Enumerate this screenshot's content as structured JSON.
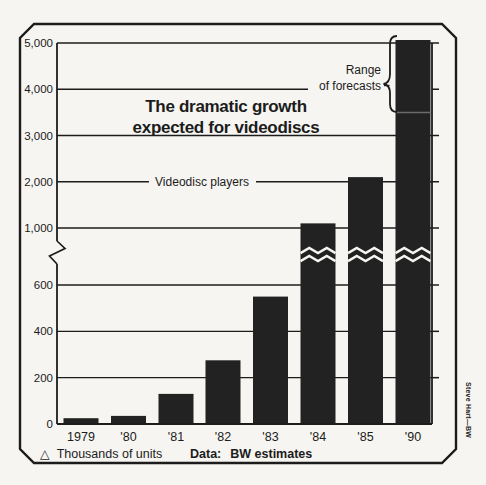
{
  "chart_data": {
    "type": "bar",
    "title_line1": "The dramatic growth",
    "title_line2": "expected for videodiscs",
    "series_label": "Videodisc players",
    "categories": [
      "1979",
      "'80",
      "'81",
      "'82",
      "'83",
      "'84",
      "'85",
      "'90"
    ],
    "values": [
      25,
      35,
      130,
      275,
      550,
      1100,
      2100,
      5000
    ],
    "bar_1990_forecast_range": {
      "low": 3500,
      "high": 5000
    },
    "range_annotation_line1": "Range",
    "range_annotation_line2": "of forecasts",
    "y_axis": {
      "upper_ticks": [
        {
          "value": 5000,
          "label": "5,000"
        },
        {
          "value": 4000,
          "label": "4,000"
        },
        {
          "value": 3000,
          "label": "3,000"
        },
        {
          "value": 2000,
          "label": "2,000"
        },
        {
          "value": 1000,
          "label": "1,000"
        }
      ],
      "lower_ticks": [
        {
          "value": 600,
          "label": "600"
        },
        {
          "value": 400,
          "label": "400"
        },
        {
          "value": 200,
          "label": "200"
        },
        {
          "value": 0,
          "label": "0"
        }
      ],
      "axis_break_between": [
        600,
        1000
      ]
    },
    "grid": true,
    "units_symbol": "△",
    "units_label": "Thousands of units",
    "source_label": "Data:",
    "source_value": "BW estimates",
    "credit": "Steve Hart—BW",
    "colors": {
      "ink": "#1c1c1c",
      "bar": "#222222",
      "paper": "#f6f5f1",
      "forecast_divider": "#6b6b6b"
    }
  }
}
